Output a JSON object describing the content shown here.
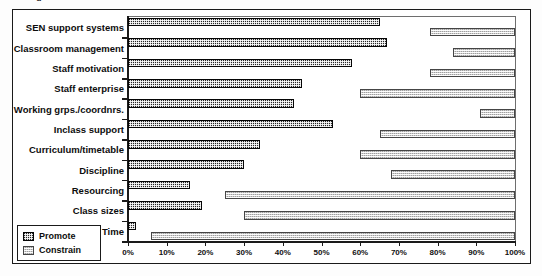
{
  "caption_sliver": "g",
  "legend": {
    "items": [
      {
        "label": "Promote",
        "swatch": "dark-checker-swatch",
        "color": "#262626"
      },
      {
        "label": "Constrain",
        "swatch": "light-checker-swatch",
        "color": "#cfcfcf"
      }
    ]
  },
  "chart_data": {
    "type": "bar",
    "orientation": "horizontal",
    "title": "",
    "xlabel": "",
    "ylabel": "",
    "xlim": [
      0,
      100
    ],
    "xticks": [
      0,
      10,
      20,
      30,
      40,
      50,
      60,
      70,
      80,
      90,
      100
    ],
    "xtick_labels": [
      "0%",
      "10%",
      "20%",
      "30%",
      "40%",
      "50%",
      "60%",
      "70%",
      "80%",
      "90%",
      "100%"
    ],
    "grid": false,
    "legend_position": "bottom-left",
    "note": "Constrain bars are drawn as floating spans running from their start value to 100%.",
    "categories": [
      "SEN support systems",
      "Classroom management",
      "Staff motivation",
      "Staff enterprise",
      "Working grps./coordnrs.",
      "Inclass support",
      "Curriculum/timetable",
      "Discipline",
      "Resourcing",
      "Class sizes",
      "Time"
    ],
    "series": [
      {
        "name": "Promote",
        "color": "#262626",
        "values": [
          65,
          67,
          58,
          45,
          43,
          53,
          34,
          30,
          16,
          19,
          2
        ]
      },
      {
        "name": "Constrain",
        "color": "#cfcfcf",
        "start_values": [
          78,
          84,
          78,
          60,
          91,
          65,
          60,
          68,
          25,
          30,
          6
        ],
        "end_values": [
          100,
          100,
          100,
          100,
          100,
          100,
          100,
          100,
          100,
          100,
          100
        ],
        "values": [
          22,
          16,
          22,
          40,
          9,
          35,
          40,
          32,
          75,
          70,
          94
        ]
      }
    ]
  }
}
